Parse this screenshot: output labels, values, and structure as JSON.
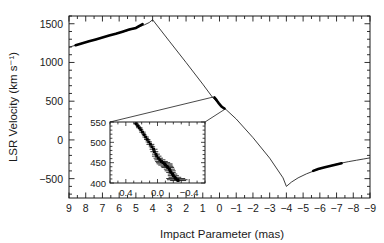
{
  "figure": {
    "background": "#ffffff",
    "ink": "#1a1a1a",
    "data_color": "#000000"
  },
  "chart_data": {
    "type": "scatter",
    "title": "",
    "xlabel": "Impact Parameter (mas)",
    "ylabel": "LSR Velocity (km s⁻¹)",
    "xlim": [
      9,
      -9
    ],
    "ylim": [
      -750,
      1600
    ],
    "x_reversed": true,
    "grid": false,
    "legend": "none",
    "xticks": [
      9,
      8,
      7,
      6,
      5,
      4,
      3,
      2,
      1,
      0,
      -1,
      -2,
      -3,
      -4,
      -5,
      -6,
      -7,
      -8,
      -9
    ],
    "xticklabels": [
      "9",
      "8",
      "7",
      "6",
      "5",
      "4",
      "3",
      "2",
      "1",
      "0",
      "-1",
      "-2",
      "-3",
      "-4",
      "-5",
      "-6",
      "-7",
      "-8",
      "-9"
    ],
    "xminor_step": 0.5,
    "yticks": [
      1500,
      1000,
      500,
      0,
      -500
    ],
    "yticklabels": [
      "1500",
      "1000",
      "500",
      "0",
      "−500"
    ],
    "yminor_step": 100,
    "series": [
      {
        "name": "model-curve-left-branch",
        "style": "line",
        "comment": "rising branch from x=9 to turnover at x=4",
        "x": [
          9.0,
          8.5,
          8.0,
          7.5,
          7.0,
          6.5,
          6.0,
          5.5,
          5.0,
          4.5,
          4.2,
          4.0
        ],
        "y": [
          1197,
          1230,
          1262,
          1293,
          1323,
          1352,
          1382,
          1412,
          1445,
          1485,
          1516,
          1552
        ]
      },
      {
        "name": "model-curve-central-branch",
        "style": "line",
        "comment": "steep descent through the origin cluster",
        "x": [
          4.0,
          3.0,
          2.0,
          1.0,
          0.4,
          0.0,
          -0.4,
          -1.0,
          -2.0,
          -3.0,
          -3.8,
          -4.0
        ],
        "y": [
          1552,
          1275,
          1000,
          720,
          545,
          462,
          390,
          270,
          30,
          -235,
          -490,
          -600
        ]
      },
      {
        "name": "model-curve-right-branch",
        "style": "line",
        "comment": "rising branch from turnover at x=-4 out to x=-9",
        "x": [
          -4.0,
          -4.3,
          -4.7,
          -5.2,
          -5.7,
          -6.2,
          -6.7,
          -7.2,
          -7.7,
          -8.2,
          -8.6,
          -9.0
        ],
        "y": [
          -600,
          -545,
          -490,
          -438,
          -396,
          -360,
          -329,
          -303,
          -281,
          -262,
          -247,
          -232
        ]
      },
      {
        "name": "maser-spots-left-branch",
        "style": "thick-segments",
        "x": [
          8.6,
          8.2,
          7.8,
          7.4,
          7.0,
          6.6,
          6.2,
          5.8,
          5.4,
          5.0,
          4.6
        ],
        "y": [
          1222,
          1248,
          1273,
          1298,
          1323,
          1347,
          1371,
          1397,
          1425,
          1446,
          1495
        ]
      },
      {
        "name": "maser-spots-origin-cluster",
        "style": "thick-segments",
        "x": [
          0.3,
          0.2,
          0.12,
          0.05,
          0.0,
          -0.05,
          -0.12,
          -0.2,
          -0.3
        ],
        "y": [
          548,
          520,
          495,
          475,
          462,
          448,
          432,
          418,
          405
        ]
      },
      {
        "name": "maser-spots-right-branch",
        "style": "thick-segments",
        "x": [
          -5.6,
          -5.9,
          -6.3,
          -6.8,
          -7.3
        ],
        "y": [
          -400,
          -377,
          -353,
          -327,
          -302
        ]
      }
    ],
    "inset": {
      "comment": "zoomed view of the dense maser cluster near zero impact parameter",
      "type": "scatter",
      "xlim": [
        0.6,
        -0.6
      ],
      "ylim": [
        400,
        550
      ],
      "x_reversed": true,
      "xticks": [
        0.4,
        0.0,
        -0.4
      ],
      "xticklabels": [
        "0.4",
        "0.0",
        "−0.4"
      ],
      "xminor_step": 0.1,
      "yticks": [
        550,
        500,
        450,
        400
      ],
      "yticklabels": [
        "550",
        "500",
        "450",
        "400"
      ],
      "yminor_step": 10,
      "points": [
        {
          "x": 0.27,
          "y": 546,
          "xerr": 0.03
        },
        {
          "x": 0.25,
          "y": 541,
          "xerr": 0.03
        },
        {
          "x": 0.23,
          "y": 536,
          "xerr": 0.04
        },
        {
          "x": 0.21,
          "y": 531,
          "xerr": 0.03
        },
        {
          "x": 0.19,
          "y": 525,
          "xerr": 0.04
        },
        {
          "x": 0.17,
          "y": 519,
          "xerr": 0.03
        },
        {
          "x": 0.15,
          "y": 513,
          "xerr": 0.04
        },
        {
          "x": 0.13,
          "y": 507,
          "xerr": 0.04
        },
        {
          "x": 0.11,
          "y": 501,
          "xerr": 0.04
        },
        {
          "x": 0.09,
          "y": 495,
          "xerr": 0.05
        },
        {
          "x": 0.07,
          "y": 489,
          "xerr": 0.04
        },
        {
          "x": 0.05,
          "y": 483,
          "xerr": 0.05
        },
        {
          "x": 0.04,
          "y": 477,
          "xerr": 0.05
        },
        {
          "x": 0.02,
          "y": 471,
          "xerr": 0.05
        },
        {
          "x": 0.01,
          "y": 466,
          "xerr": 0.06
        },
        {
          "x": -0.01,
          "y": 461,
          "xerr": 0.06
        },
        {
          "x": -0.03,
          "y": 457,
          "xerr": 0.07
        },
        {
          "x": -0.05,
          "y": 453,
          "xerr": 0.08
        },
        {
          "x": -0.07,
          "y": 450,
          "xerr": 0.09
        },
        {
          "x": -0.09,
          "y": 447,
          "xerr": 0.1
        },
        {
          "x": -0.1,
          "y": 444,
          "xerr": 0.09
        },
        {
          "x": -0.12,
          "y": 441,
          "xerr": 0.08
        },
        {
          "x": -0.13,
          "y": 438,
          "xerr": 0.08
        },
        {
          "x": -0.15,
          "y": 434,
          "xerr": 0.07
        },
        {
          "x": -0.16,
          "y": 430,
          "xerr": 0.07
        },
        {
          "x": -0.17,
          "y": 426,
          "xerr": 0.06
        },
        {
          "x": -0.19,
          "y": 422,
          "xerr": 0.06
        },
        {
          "x": -0.2,
          "y": 418,
          "xerr": 0.07
        },
        {
          "x": -0.22,
          "y": 414,
          "xerr": 0.08
        },
        {
          "x": -0.23,
          "y": 411,
          "xerr": 0.12
        },
        {
          "x": -0.25,
          "y": 408,
          "xerr": 0.13
        },
        {
          "x": -0.26,
          "y": 406,
          "xerr": 0.1
        }
      ]
    }
  }
}
